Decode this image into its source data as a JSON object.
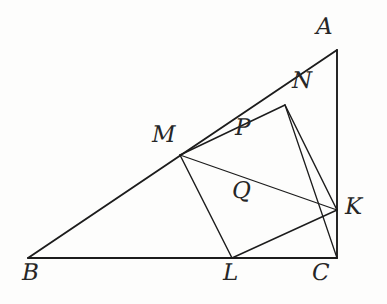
{
  "figure": {
    "width": 387,
    "height": 304,
    "background_color": "#fdfdfc",
    "ink_color": "#1c1c1c",
    "label_color": "#262626"
  },
  "points": {
    "A": {
      "name": "A",
      "x": 337,
      "y": 50,
      "label_x": 316,
      "label_y": 16
    },
    "B": {
      "name": "B",
      "x": 28,
      "y": 258,
      "label_x": 22,
      "label_y": 262
    },
    "C": {
      "name": "C",
      "x": 337,
      "y": 258,
      "label_x": 312,
      "label_y": 262
    },
    "K": {
      "name": "K",
      "x": 337,
      "y": 210,
      "label_x": 345,
      "label_y": 196
    },
    "L": {
      "name": "L",
      "x": 232,
      "y": 258,
      "label_x": 223,
      "label_y": 262
    },
    "M": {
      "name": "M",
      "x": 180,
      "y": 155,
      "label_x": 152,
      "label_y": 124
    },
    "N": {
      "name": "N",
      "x": 285,
      "y": 105,
      "label_x": 292,
      "label_y": 70
    },
    "P": {
      "name": "P",
      "x": 243,
      "y": 140,
      "label_x": 235,
      "label_y": 117
    },
    "Q": {
      "name": "Q",
      "x": 253,
      "y": 186,
      "label_x": 232,
      "label_y": 180
    }
  },
  "labels": [
    {
      "id": "A",
      "text": "A"
    },
    {
      "id": "B",
      "text": "B"
    },
    {
      "id": "C",
      "text": "C"
    },
    {
      "id": "K",
      "text": "K"
    },
    {
      "id": "L",
      "text": "L"
    },
    {
      "id": "M",
      "text": "M"
    },
    {
      "id": "N",
      "text": "N"
    },
    {
      "id": "P",
      "text": "P"
    },
    {
      "id": "Q",
      "text": "Q"
    }
  ],
  "segments": [
    {
      "id": "BC",
      "from": "B",
      "to": "C",
      "style": "base"
    },
    {
      "id": "AC",
      "from": "A",
      "to": "C",
      "style": "base"
    },
    {
      "id": "BA",
      "from": "B",
      "to": "A",
      "style": "base"
    },
    {
      "id": "MN",
      "from": "M",
      "to": "N",
      "style": "normal"
    },
    {
      "id": "NK",
      "from": "N",
      "to": "K",
      "style": "normal"
    },
    {
      "id": "KL",
      "from": "K",
      "to": "L",
      "style": "normal"
    },
    {
      "id": "LM",
      "from": "L",
      "to": "M",
      "style": "normal"
    },
    {
      "id": "MK",
      "from": "M",
      "to": "K",
      "style": "normal"
    },
    {
      "id": "NC",
      "from": "N",
      "to": "C",
      "style": "normal"
    }
  ],
  "notes": {
    "collinear_BMA": "M lies on side AB",
    "collinear_BLC": "L lies on side BC",
    "collinear_AKC": "K lies on side AC",
    "collinear_ANM": "N lies on side AB between A and M",
    "P_definition": "P labels the region near segment MN above MK",
    "Q_definition": "Q labels the intersection region of MK and NC"
  }
}
